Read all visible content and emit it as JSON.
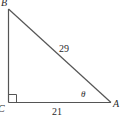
{
  "figure": {
    "type": "right-triangle",
    "stroke_color": "#555555",
    "label_color": "#2a2a2a",
    "vertices": {
      "B": {
        "label": "B"
      },
      "C": {
        "label": "C",
        "right_angle": true
      },
      "A": {
        "label": "A"
      }
    },
    "sides": {
      "hypotenuse_BA": {
        "label": "29"
      },
      "leg_CA": {
        "label": "21"
      }
    },
    "angles": {
      "at_A": {
        "label": "θ"
      }
    }
  }
}
